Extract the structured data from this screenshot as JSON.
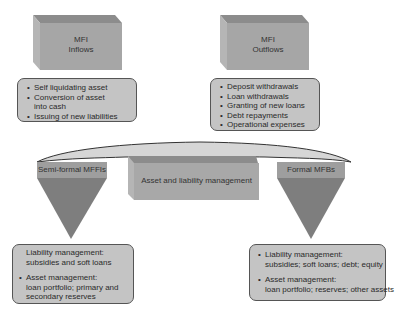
{
  "inflows_box": {
    "line1": "MFI",
    "line2": "Inflows"
  },
  "outflows_box": {
    "line1": "MFI",
    "line2": "Outflows"
  },
  "inflows_list": [
    "Self liquidating asset",
    "Conversion of asset into cash",
    "Issuing of new liabilities"
  ],
  "outflows_list": [
    "Deposit withdrawals",
    "Loan withdrawals",
    "Granting of new loans",
    "Debt repayments",
    "Operational expenses"
  ],
  "center_box": {
    "label": "Asset and liability management"
  },
  "left_funnel": {
    "label": "Semi-formal MFFIs"
  },
  "right_funnel": {
    "label": "Formal MFBs"
  },
  "left_card": {
    "liability_title": "Liability management:",
    "liability_detail": "subsidies and soft loans",
    "asset_title": "Asset management:",
    "asset_detail_1": "loan portfolio; primary and",
    "asset_detail_2": "secondary reserves"
  },
  "right_card": {
    "liability_title": "Liability management:",
    "liability_detail": "subsidies; soft loans; debt; equity",
    "asset_title": "Asset management:",
    "asset_detail": "loan portfolio; reserves; other assets"
  },
  "colors": {
    "box_front": "#a8a8a8",
    "box_top": "#8a8a8a",
    "box_side": "#b8b8b8",
    "funnel_band": "#9c9c9c",
    "funnel_body": "#7e7e7e",
    "card_fill": "#c4c4c4",
    "arc_fill": "#d4d4d4"
  }
}
